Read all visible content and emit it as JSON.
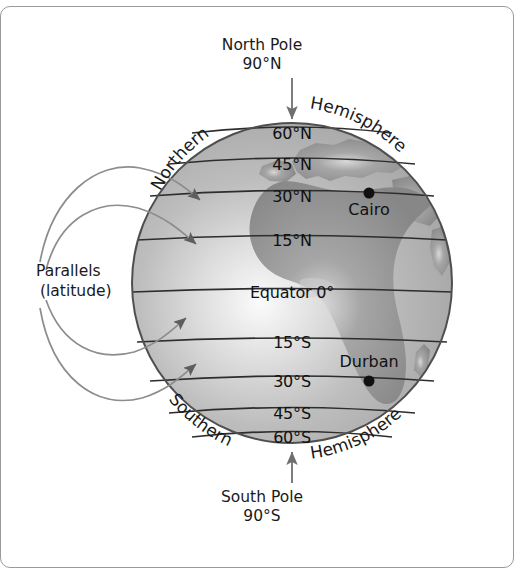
{
  "figure": {
    "kind": "latitude-globe-diagram",
    "frame_border_color": "#9a9a9a",
    "background_color": "#ffffff"
  },
  "globe": {
    "center_x": 292,
    "center_y": 283,
    "radius": 160,
    "ocean_color": "#b9b9b9",
    "land_color": "#8e8e8e",
    "highlight_color": "#f2f2f2",
    "outline_color": "#4a4a4a"
  },
  "poles": {
    "north": {
      "name": "North Pole",
      "coordinate": "90°N"
    },
    "south": {
      "name": "South Pole",
      "coordinate": "90°S"
    }
  },
  "hemispheres": {
    "northern": {
      "word1": "Northern",
      "word2": "Hemisphere"
    },
    "southern": {
      "word1": "Southern",
      "word2": "Hemisphere"
    }
  },
  "callout": {
    "line1": "Parallels",
    "line2": "(latitude)"
  },
  "parallels": [
    {
      "label": "60°N",
      "latitude": 60,
      "y": 133,
      "half_width": 100
    },
    {
      "label": "45°N",
      "latitude": 45,
      "y": 164,
      "half_width": 123
    },
    {
      "label": "30°N",
      "latitude": 30,
      "y": 196,
      "half_width": 142
    },
    {
      "label": "15°N",
      "latitude": 15,
      "y": 240,
      "half_width": 155
    },
    {
      "label": "Equator 0°",
      "latitude": 0,
      "y": 292,
      "half_width": 160
    },
    {
      "label": "15°S",
      "latitude": -15,
      "y": 342,
      "half_width": 155
    },
    {
      "label": "30°S",
      "latitude": -30,
      "y": 381,
      "half_width": 142
    },
    {
      "label": "45°S",
      "latitude": -45,
      "y": 413,
      "half_width": 123
    },
    {
      "label": "60°S",
      "latitude": -60,
      "y": 437,
      "half_width": 100
    }
  ],
  "cities": [
    {
      "name": "Cairo",
      "dot_x": 369,
      "dot_y": 193,
      "label_x": 369,
      "label_y": 200
    },
    {
      "name": "Durban",
      "dot_x": 369,
      "dot_y": 381,
      "label_x": 369,
      "label_y": 352
    }
  ],
  "axis_arrows": {
    "north_arrow_color": "#6d6d6d",
    "south_arrow_color": "#6d6d6d"
  },
  "callout_arrows": {
    "color": "#8d8d8d",
    "count": 4
  }
}
